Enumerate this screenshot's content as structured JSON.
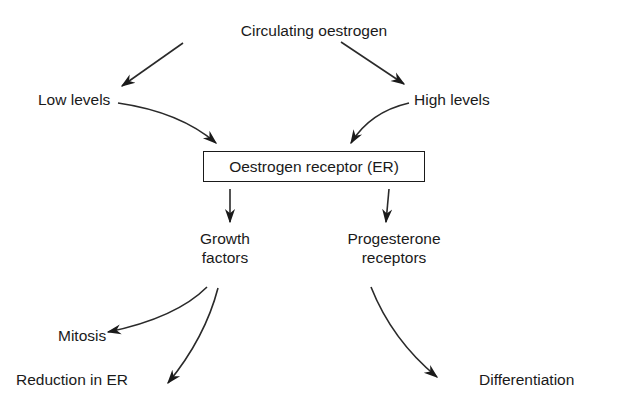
{
  "diagram": {
    "type": "flowchart",
    "nodes": {
      "circulating": "Circulating oestrogen",
      "low": "Low levels",
      "high": "High levels",
      "receptor": "Oestrogen receptor (ER)",
      "growth_line1": "Growth",
      "growth_line2": "factors",
      "progesterone_line1": "Progesterone",
      "progesterone_line2": "receptors",
      "mitosis": "Mitosis",
      "reduction": "Reduction in ER",
      "differentiation": "Differentiation"
    },
    "edges": [
      {
        "from": "Circulating oestrogen",
        "to": "Low levels"
      },
      {
        "from": "Circulating oestrogen",
        "to": "High levels"
      },
      {
        "from": "Low levels",
        "to": "Oestrogen receptor (ER)"
      },
      {
        "from": "High levels",
        "to": "Oestrogen receptor (ER)"
      },
      {
        "from": "Oestrogen receptor (ER)",
        "to": "Growth factors"
      },
      {
        "from": "Oestrogen receptor (ER)",
        "to": "Progesterone receptors"
      },
      {
        "from": "Growth factors",
        "to": "Mitosis"
      },
      {
        "from": "Growth factors",
        "to": "Reduction in ER"
      },
      {
        "from": "Progesterone receptors",
        "to": "Differentiation"
      }
    ],
    "colors": {
      "ink": "#1a1a1a",
      "background": "#ffffff"
    }
  }
}
